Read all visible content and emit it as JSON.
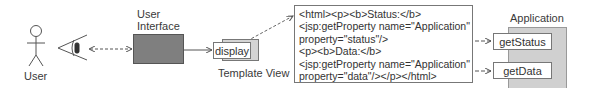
{
  "actor": {
    "label": "User",
    "icon": "stick-figure-icon"
  },
  "eye": {
    "icon": "eye-icon"
  },
  "user_interface": {
    "label_line1": "User",
    "label_line2": "Interface"
  },
  "template_view": {
    "button_label": "display",
    "caption": "Template View"
  },
  "jsp_template": {
    "lines": [
      "<html><p><b>Status:</b>",
      "<jsp:getProperty name=\"Application\"",
      "property=\"status\"/>",
      "<p><b>Data:</b>",
      "<jsp:getProperty name=\"Application\"",
      "property=\"data\"/></p></html>"
    ]
  },
  "application": {
    "label": "Application",
    "methods": [
      "getStatus",
      "getData"
    ]
  },
  "colors": {
    "ui_box_fill": "#7f7f7f",
    "application_fill": "#d0d0d0",
    "display_shadow_fill": "#d4d4d4",
    "line": "#555555"
  }
}
